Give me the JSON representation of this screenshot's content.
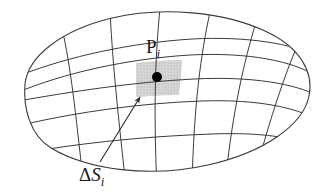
{
  "figure": {
    "background_color": "#ffffff",
    "line_color": "#3a3a3a",
    "shade_color": "#d6d6d6",
    "dot_color": "#000000",
    "width": 334,
    "height": 196
  },
  "labels": {
    "point": {
      "base": "P",
      "subscript": "i",
      "full": "P_i",
      "x": 146,
      "y": 37
    },
    "area_element": {
      "delta": "Δ",
      "base": "S",
      "subscript": "i",
      "full": "ΔS_i",
      "x": 79,
      "y": 165
    }
  },
  "annotations": {
    "leader_arrow": {
      "name": "arrow-to-patch",
      "from_x": 100,
      "from_y": 162,
      "to_x": 139,
      "to_y": 96
    },
    "sample_point_dot": {
      "cx": 157,
      "cy": 77,
      "r": 5
    }
  },
  "geometry": {
    "outline": "M 25,84 C 28,56 62,30 112,18 C 163,6 224,12 265,31 C 300,47 314,72 309,96 C 303,126 262,153 208,165 C 150,178 88,170 51,148 C 30,135 23,108 25,84 Z",
    "u_curves": [
      "M 26,76 C 70,58 130,44 190,40 C 243,37 288,44 312,56",
      "M 25,92 C 64,74 126,60 188,56 C 245,53 291,61 311,76",
      "M 27,100 C 70,92 132,83 192,80 C 250,77 293,84 310,95",
      "M 34,122 C 78,112 140,104 200,102 C 255,100 292,108 305,118",
      "M 51,148 C 98,142 155,137 210,135 C 258,133 288,138 296,143"
    ],
    "v_curves": [
      "M 62,31 C 70,60 74,98 80,156",
      "M 110,19 C 112,52 116,96 124,176",
      "M 158,17 C 155,50 153,96 156,180",
      "M 207,21 C 200,54 194,100 192,178",
      "M 252,30 C 242,62 232,108 226,169",
      "M 292,50 C 280,78 268,118 258,152"
    ]
  },
  "icon_names": {
    "surface": "curved-surface-shape",
    "grid": "mesh-grid",
    "patch": "shaded-area-element",
    "dot": "sample-point-dot",
    "arrow": "leader-arrow-icon"
  }
}
